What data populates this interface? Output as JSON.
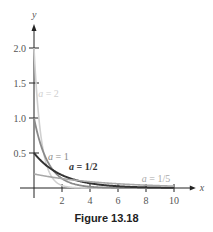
{
  "chart_data": {
    "type": "line",
    "title": "",
    "caption": "Figure 13.18",
    "xlabel": "x",
    "ylabel": "y",
    "xlim": [
      0,
      11
    ],
    "ylim": [
      0,
      2.3
    ],
    "x_ticks": [
      2,
      4,
      6,
      8,
      10
    ],
    "y_ticks": [
      0.5,
      1.0,
      1.5,
      2.0
    ],
    "x_tick_labels": [
      "2",
      "4",
      "6",
      "8",
      "10"
    ],
    "y_tick_labels": [
      "0.5",
      "1.0",
      "1.5",
      "2.0"
    ],
    "grid": false,
    "function": "y = a e^(-a x)",
    "series": [
      {
        "name": "a = 2",
        "a": 2,
        "color": "#d0d0d0",
        "width": 1.6,
        "label_x": 0.3,
        "label_y": 1.3,
        "x": [
          0,
          0.25,
          0.5,
          1,
          1.5,
          2,
          3,
          4,
          6,
          8,
          10
        ],
        "values": [
          2.0,
          1.21,
          0.74,
          0.27,
          0.1,
          0.04,
          0.005,
          0.0007,
          0,
          0,
          0
        ]
      },
      {
        "name": "a = 1",
        "a": 1,
        "color": "#8a8a8a",
        "width": 1.8,
        "label_x": 1.0,
        "label_y": 0.4,
        "x": [
          0,
          0.5,
          1,
          1.5,
          2,
          3,
          4,
          6,
          8,
          10
        ],
        "values": [
          1.0,
          0.61,
          0.37,
          0.22,
          0.14,
          0.05,
          0.018,
          0.002,
          0.0003,
          0
        ]
      },
      {
        "name": "a = 1/2",
        "a": 0.5,
        "color": "#333333",
        "width": 2.0,
        "label_x": 2.5,
        "label_y": 0.26,
        "x": [
          0,
          1,
          2,
          3,
          4,
          6,
          8,
          10
        ],
        "values": [
          0.5,
          0.3,
          0.18,
          0.11,
          0.068,
          0.025,
          0.009,
          0.003
        ]
      },
      {
        "name": "a = 1/5",
        "a": 0.2,
        "color": "#a8a8a8",
        "width": 1.6,
        "label_x": 7.7,
        "label_y": 0.09,
        "x": [
          0,
          2,
          4,
          6,
          8,
          10
        ],
        "values": [
          0.2,
          0.134,
          0.09,
          0.06,
          0.04,
          0.027
        ]
      }
    ]
  },
  "axes": {
    "x_label": "x",
    "y_label": "y"
  },
  "caption": "Figure 13.18"
}
